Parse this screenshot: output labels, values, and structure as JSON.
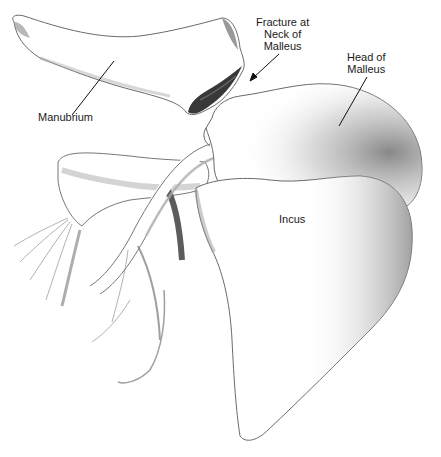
{
  "figure": {
    "style": "pencil illustration"
  },
  "labels": {
    "manubrium": "Manubrium",
    "fracture": [
      "Fracture at",
      "Neck of",
      "Malleus"
    ],
    "head": [
      "Head of",
      "Malleus"
    ],
    "incus": "Incus"
  },
  "colors": {
    "background": "#ffffff",
    "outline": "#555555",
    "shade_light": "#d9d9d9",
    "shade_mid": "#9a9a9a",
    "shade_dark": "#2a2a2a",
    "leader_line": "#111111"
  }
}
